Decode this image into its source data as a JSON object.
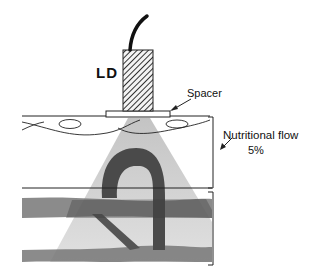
{
  "labels": {
    "ld": "LD",
    "spacer": "Spacer",
    "nutritional_flow": "Nutritional flow",
    "percent": "5%"
  },
  "colors": {
    "line": "#222222",
    "vessel": "#6a6a6a",
    "vessel_dark": "#3c3c3c",
    "beam": "#dcdcdc",
    "background": "#ffffff"
  }
}
